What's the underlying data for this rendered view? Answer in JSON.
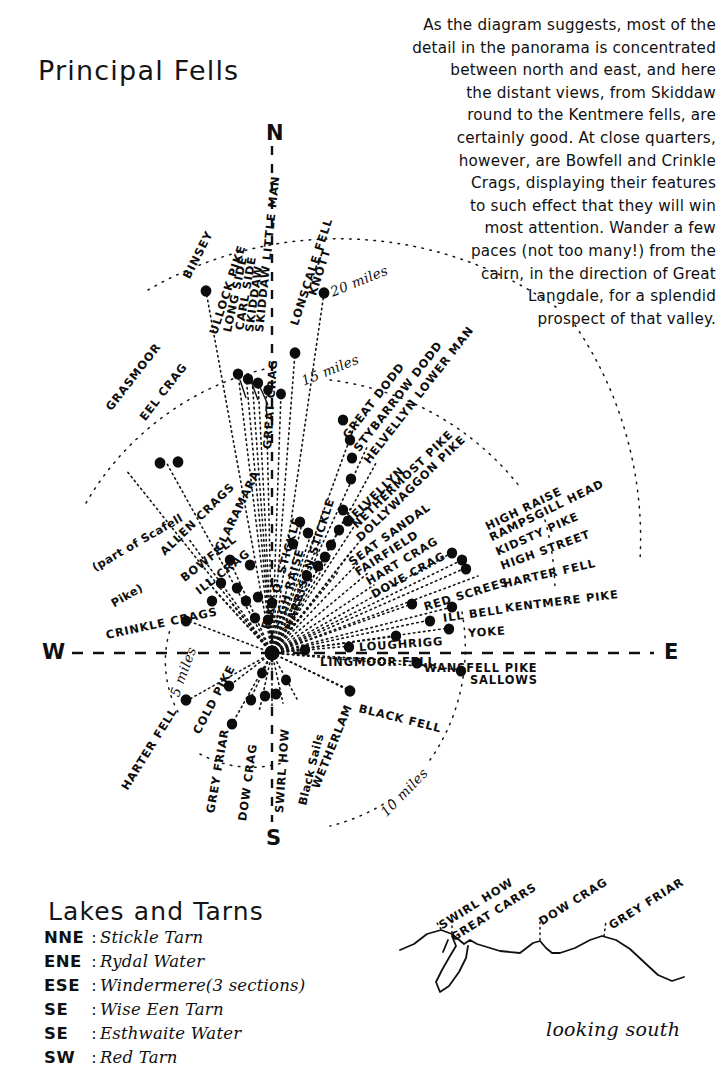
{
  "page": {
    "title": "Principal Fells",
    "lakes_title": "Lakes and Tarns",
    "looking_south": "looking south"
  },
  "intro": {
    "lines": [
      "As the diagram suggests, most of the",
      "detail in the panorama is concentrated",
      "between north and east, and here",
      "the distant views, from Skiddaw",
      "round to the Kentmere fells, are",
      "certainly good. At close quarters,",
      "however, are Bowfell and Crinkle",
      "Crags, displaying their features",
      "to such effect that they will win",
      "most attention.  Wander a few",
      "paces (not too many!) from the",
      "cairn, in the direction of Great",
      "Langdale, for a splendid",
      "prospect of that valley."
    ]
  },
  "compass": {
    "n": "N",
    "e": "E",
    "s": "S",
    "w": "W"
  },
  "distance_rings": [
    {
      "label": "20 miles",
      "x": 331,
      "y": 284,
      "rot": -22
    },
    {
      "label": "15 miles",
      "x": 302,
      "y": 373,
      "rot": -22
    },
    {
      "label": "10 miles",
      "x": 383,
      "y": 806,
      "rot": -46
    },
    {
      "label": "5 miles",
      "x": 174,
      "y": 688,
      "rot": -70
    }
  ],
  "fells": [
    {
      "name": "BINSEY",
      "x": 186,
      "y": 271,
      "rot": -63
    },
    {
      "name": "ULLOCK PIKE",
      "x": 213,
      "y": 327,
      "rot": -72
    },
    {
      "name": "LONG SIDE",
      "x": 227,
      "y": 325,
      "rot": -78
    },
    {
      "name": "CARL SIDE",
      "x": 239,
      "y": 323,
      "rot": -80
    },
    {
      "name": "SKIDDAW",
      "x": 249,
      "y": 325,
      "rot": -82
    },
    {
      "name": "SKIDDAW LITTLE MAN",
      "x": 259,
      "y": 325,
      "rot": -84
    },
    {
      "name": "LONSCALE FELL",
      "x": 294,
      "y": 318,
      "rot": -72
    },
    {
      "name": "KNOTT",
      "x": 312,
      "y": 288,
      "rot": -72
    },
    {
      "name": "GREAT CRAG",
      "x": 267,
      "y": 442,
      "rot": -86
    },
    {
      "name": "GREAT DODD",
      "x": 345,
      "y": 430,
      "rot": -52
    },
    {
      "name": "STYBARROW DODD",
      "x": 356,
      "y": 443,
      "rot": -52
    },
    {
      "name": "HELVELLYN LOWER MAN",
      "x": 366,
      "y": 455,
      "rot": -52
    },
    {
      "name": "HELVELLYN",
      "x": 346,
      "y": 516,
      "rot": -44
    },
    {
      "name": "NETHERMOST PIKE",
      "x": 354,
      "y": 519,
      "rot": -44
    },
    {
      "name": "DOLLYWAGGON PIKE",
      "x": 358,
      "y": 532,
      "rot": -44
    },
    {
      "name": "SEAT SANDAL",
      "x": 350,
      "y": 556,
      "rot": -36
    },
    {
      "name": "FAIRFIELD",
      "x": 356,
      "y": 566,
      "rot": -33
    },
    {
      "name": "HART CRAG",
      "x": 367,
      "y": 575,
      "rot": -31
    },
    {
      "name": "DOVE CRAG",
      "x": 372,
      "y": 588,
      "rot": -29
    },
    {
      "name": "PIKE O' STICKLE",
      "x": 265,
      "y": 622,
      "rot": -74
    },
    {
      "name": "HIGH RAISE",
      "x": 277,
      "y": 622,
      "rot": -74
    },
    {
      "name": "HARRISON STICKLE",
      "x": 288,
      "y": 623,
      "rot": -72
    },
    {
      "name": "CLARAMARA",
      "x": 218,
      "y": 543,
      "rot": -64
    },
    {
      "name": "EEL CRAG",
      "x": 142,
      "y": 412,
      "rot": -52
    },
    {
      "name": "GRASMOOR",
      "x": 108,
      "y": 402,
      "rot": -52
    },
    {
      "name": "ALLEN CRAGS",
      "x": 162,
      "y": 546,
      "rot": -44
    },
    {
      "name": "BOWFELL",
      "x": 182,
      "y": 572,
      "rot": -38
    },
    {
      "name": "ILL CRAG",
      "x": 197,
      "y": 585,
      "rot": -38
    },
    {
      "name": "(part of Scafell",
      "x": 93,
      "y": 561,
      "rot": -30,
      "lc": true
    },
    {
      "name": "Pike)",
      "x": 112,
      "y": 597,
      "rot": -30,
      "lc": true
    },
    {
      "name": "CRINKLE CRAGS",
      "x": 106,
      "y": 628,
      "rot": -12
    },
    {
      "name": "HIGH RAISE",
      "x": 486,
      "y": 520,
      "rot": -26
    },
    {
      "name": "RAMPSGILL HEAD",
      "x": 490,
      "y": 531,
      "rot": -26
    },
    {
      "name": "KIDSTY PIKE",
      "x": 496,
      "y": 545,
      "rot": -24
    },
    {
      "name": "HIGH STREET",
      "x": 501,
      "y": 559,
      "rot": -20
    },
    {
      "name": "RED SCREES",
      "x": 424,
      "y": 600,
      "rot": -17
    },
    {
      "name": "HARTER FELL",
      "x": 503,
      "y": 577,
      "rot": -13
    },
    {
      "name": "ILL BELL",
      "x": 443,
      "y": 611,
      "rot": -8
    },
    {
      "name": "KENTMERE PIKE",
      "x": 505,
      "y": 601,
      "rot": -7
    },
    {
      "name": "YOKE",
      "x": 468,
      "y": 626,
      "rot": -4
    },
    {
      "name": "LOUGHRIGG",
      "x": 359,
      "y": 640,
      "rot": -4
    },
    {
      "name": "LINGMOOR FELL",
      "x": 320,
      "y": 655,
      "rot": 0
    },
    {
      "name": "WANSFELL PIKE",
      "x": 424,
      "y": 661,
      "rot": 0
    },
    {
      "name": "SALLOWS",
      "x": 470,
      "y": 673,
      "rot": 0
    },
    {
      "name": "BLACK FELL",
      "x": 359,
      "y": 701,
      "rot": 14
    },
    {
      "name": "HARTER FELL",
      "x": 124,
      "y": 782,
      "rot": -58
    },
    {
      "name": "COLD PIKE",
      "x": 196,
      "y": 726,
      "rot": -62
    },
    {
      "name": "GREY FRIAR",
      "x": 210,
      "y": 806,
      "rot": -80
    },
    {
      "name": "DOW CRAG",
      "x": 242,
      "y": 814,
      "rot": -82
    },
    {
      "name": "SWIRL HOW",
      "x": 279,
      "y": 806,
      "rot": -86
    },
    {
      "name": "Black Sails",
      "x": 302,
      "y": 798,
      "rot": -76,
      "lc": true
    },
    {
      "name": "WETHERLAM",
      "x": 315,
      "y": 781,
      "rot": -68
    }
  ],
  "panorama": {
    "labels": [
      {
        "name": "SWIRL HOW",
        "x": 440,
        "y": 919,
        "rot": -32
      },
      {
        "name": "GREAT CARRS",
        "x": 452,
        "y": 931,
        "rot": -32
      },
      {
        "name": "DOW CRAG",
        "x": 540,
        "y": 915,
        "rot": -32
      },
      {
        "name": "GREY FRIAR",
        "x": 610,
        "y": 919,
        "rot": -32
      }
    ]
  },
  "lakes_and_tarns": [
    {
      "dir": "NNE",
      "name": "Stickle Tarn",
      "note": ""
    },
    {
      "dir": "ENE",
      "name": "Rydal Water",
      "note": ""
    },
    {
      "dir": "ESE",
      "name": "Windermere",
      "note": "(3 sections)"
    },
    {
      "dir": "SE",
      "name": "Wise Een Tarn",
      "note": ""
    },
    {
      "dir": "SE",
      "name": "Esthwaite Water",
      "note": ""
    },
    {
      "dir": "SW",
      "name": "Red Tarn",
      "note": ""
    }
  ],
  "colors": {
    "ink": "#101010",
    "paper": "#ffffff"
  },
  "hub": {
    "x": 272,
    "y": 653
  }
}
